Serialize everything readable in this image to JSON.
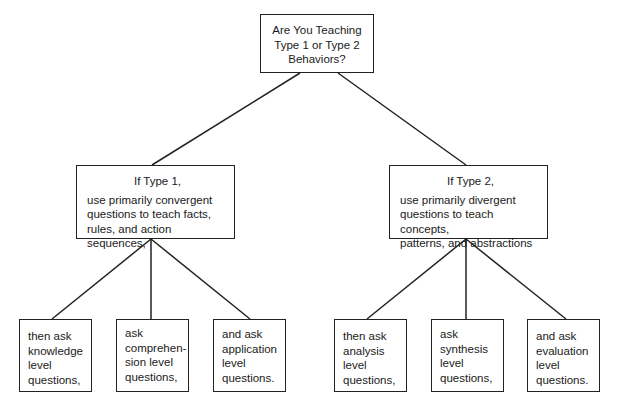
{
  "page": {
    "clipped_header_text": "Figure: Sequencing questions for Type 1 and Type 2 behaviors"
  },
  "diagram": {
    "root": {
      "lines": [
        "Are You Teaching",
        "Type 1 or Type 2",
        "Behaviors?"
      ]
    },
    "branches": [
      {
        "heading": "If Type 1,",
        "lines": [
          "use primarily convergent",
          "questions to teach facts,",
          "rules, and action sequences,"
        ],
        "children": [
          {
            "lines": [
              "then ask",
              "knowledge",
              "level",
              "questions,"
            ]
          },
          {
            "lines": [
              "ask",
              "comprehen-",
              "sion level",
              "questions,"
            ]
          },
          {
            "lines": [
              "and ask",
              "application",
              "level",
              "questions."
            ]
          }
        ]
      },
      {
        "heading": "If Type 2,",
        "lines": [
          "use primarily divergent",
          "questions to teach concepts,",
          "patterns, and abstractions"
        ],
        "children": [
          {
            "lines": [
              "then ask",
              "analysis",
              "level",
              "questions,"
            ]
          },
          {
            "lines": [
              "ask",
              "synthesis",
              "level",
              "questions,"
            ]
          },
          {
            "lines": [
              "and ask",
              "evaluation",
              "level",
              "questions."
            ]
          }
        ]
      }
    ]
  }
}
